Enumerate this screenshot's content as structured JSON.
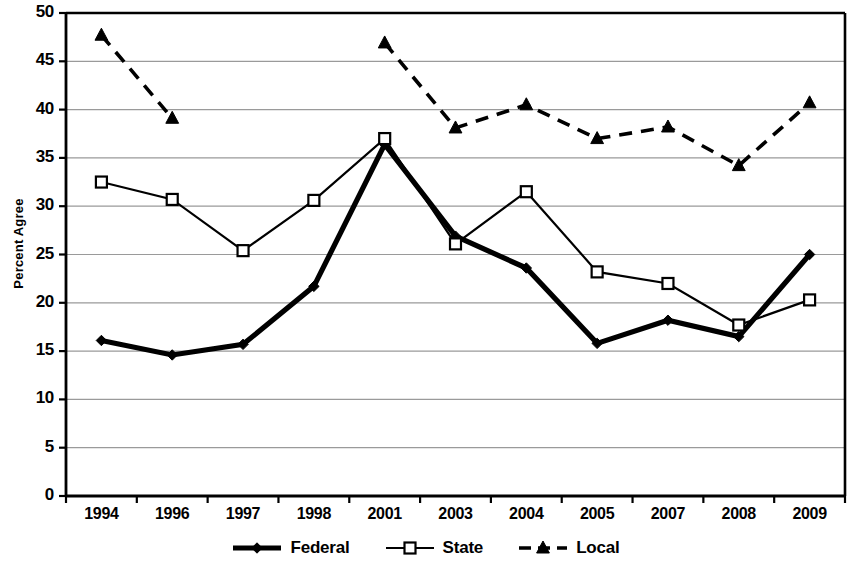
{
  "chart_data": {
    "type": "line",
    "title": "",
    "xlabel": "",
    "ylabel": "Percent Agree",
    "categories": [
      "1994",
      "1996",
      "1997",
      "1998",
      "2001",
      "2003",
      "2004",
      "2005",
      "2007",
      "2008",
      "2009"
    ],
    "ylim": [
      0,
      50
    ],
    "ytick_step": 5,
    "yticks": [
      "0",
      "5",
      "10",
      "15",
      "20",
      "25",
      "30",
      "35",
      "40",
      "45",
      "50"
    ],
    "grid": "horizontal",
    "legend_position": "bottom",
    "series": [
      {
        "name": "Federal",
        "style": "thick-solid",
        "marker": "diamond",
        "color": "#000000",
        "values": [
          16.1,
          14.6,
          15.7,
          21.7,
          36.4,
          26.9,
          23.6,
          15.8,
          18.2,
          16.5,
          25.0
        ]
      },
      {
        "name": "State",
        "style": "thin-solid",
        "marker": "open-square",
        "color": "#000000",
        "values": [
          32.5,
          30.7,
          25.4,
          30.6,
          37.0,
          26.1,
          31.5,
          23.2,
          22.0,
          17.7,
          20.3
        ]
      },
      {
        "name": "Local",
        "style": "dashed",
        "marker": "triangle",
        "color": "#000000",
        "values": [
          47.7,
          39.1,
          null,
          null,
          46.9,
          38.1,
          40.5,
          37.0,
          38.2,
          34.2,
          40.7
        ]
      }
    ]
  }
}
